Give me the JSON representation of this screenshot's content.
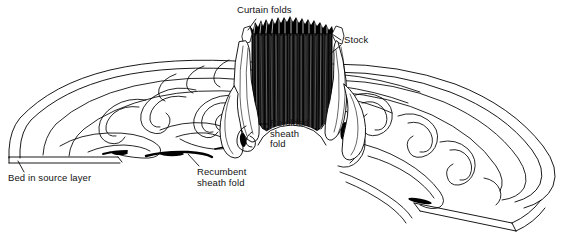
{
  "figure": {
    "domain": "geological block diagram",
    "background_color": "#ffffff",
    "ink_color": "#000000",
    "width": 577,
    "height": 240
  },
  "labels": [
    {
      "id": "curtain-folds",
      "text": "Curtain folds",
      "x": 237,
      "y": 6,
      "leader": "short line down-right to crenellated top of stock"
    },
    {
      "id": "stock",
      "text": "Stock",
      "x": 343,
      "y": 36,
      "leader": "two short lines left to the stock column flank"
    },
    {
      "id": "refolded-sheath-fold",
      "text": "Refolded\nsheath\nfold",
      "x": 269,
      "y": 119,
      "leader": "short dash left to refolded fold at stock base"
    },
    {
      "id": "recumbent-sheath-fold",
      "text": "Recumbent\nsheath fold",
      "x": 196,
      "y": 168,
      "leader": "short line up-left to dark elongated fold sliver"
    },
    {
      "id": "bed-in-source-layer",
      "text": "Bed in source layer",
      "x": 8,
      "y": 174,
      "leader": "short line up-right to left slab cut edge"
    }
  ],
  "elements": {
    "stock": "dark vertical cylindrical column with fine vertical striations at center-top",
    "curtain_folds": "jagged crenellated ridge forming the upper rim of the stock",
    "left_wing": "curved lens-shaped slab sweeping left, containing nested sinuous sheath-fold outlines",
    "right_wing": "curved slab sweeping down to the lower right, containing nested sinuous sheath-fold outlines, terminated by a cut block edge showing slab thickness",
    "source_layer": "thin horizontal layer at the left base, shown in cut section",
    "cut_edge_right": "3D slab edge at lower right showing bed thickness"
  },
  "colors": {
    "ink": "#000000",
    "paper": "#ffffff",
    "shadow": "#2a2a2a",
    "hatch": "#1a1a1a"
  }
}
